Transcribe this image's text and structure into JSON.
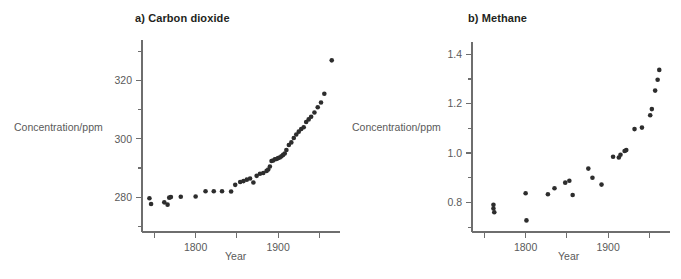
{
  "figure": {
    "background": "#ffffff",
    "point_color": "#2d2d2d",
    "axis_color": "#6e6e6e",
    "text_color": "#5a5a5a",
    "title_color": "#231f20"
  },
  "panels": {
    "a": {
      "title": "a) Carbon dioxide",
      "xlabel": "Year",
      "ylabel": "Concentration/ppm",
      "y_ticks_labeled": [
        "280",
        "300",
        "320"
      ],
      "x_ticks_labeled": [
        "1800",
        "1900"
      ]
    },
    "b": {
      "title": "b) Methane",
      "xlabel": "Year",
      "ylabel": "Concentration/ppm",
      "y_ticks_labeled": [
        "0.8",
        "1.0",
        "1.2",
        "1.4"
      ],
      "x_ticks_labeled": [
        "1800",
        "1900"
      ]
    }
  },
  "chart_data": [
    {
      "id": "carbon-dioxide",
      "type": "scatter",
      "title": "a) Carbon dioxide",
      "xlabel": "Year",
      "ylabel": "Concentration/ppm",
      "xlim": [
        1735,
        1975
      ],
      "ylim": [
        268,
        334
      ],
      "x_major_ticks": [
        1750,
        1800,
        1850,
        1900,
        1950
      ],
      "x_tick_labels": {
        "1800": "1800",
        "1900": "1900"
      },
      "y_major_ticks": [
        280,
        300,
        320
      ],
      "y_minor_ticks": [
        270,
        290,
        310,
        330
      ],
      "grid": false,
      "legend": null,
      "x": [
        1744,
        1746,
        1762,
        1766,
        1768,
        1770,
        1782,
        1800,
        1812,
        1822,
        1832,
        1843,
        1848,
        1854,
        1858,
        1862,
        1866,
        1870,
        1874,
        1878,
        1882,
        1886,
        1888,
        1890,
        1892,
        1894,
        1896,
        1898,
        1900,
        1902,
        1904,
        1906,
        1908,
        1910,
        1913,
        1916,
        1919,
        1922,
        1925,
        1928,
        1931,
        1934,
        1937,
        1940,
        1944,
        1948,
        1952,
        1956,
        1965
      ],
      "y": [
        279.6,
        277.6,
        278.2,
        277.4,
        279.8,
        280.0,
        280.1,
        280.2,
        282.0,
        282.0,
        282.0,
        281.9,
        284.2,
        285.2,
        285.5,
        286.0,
        286.4,
        285.0,
        287.3,
        288.0,
        288.3,
        289.0,
        289.5,
        290.5,
        292.4,
        292.6,
        293.0,
        293.1,
        293.4,
        293.6,
        294.0,
        294.5,
        295.0,
        296.2,
        297.9,
        298.8,
        300.3,
        301.5,
        302.5,
        303.4,
        304.0,
        305.8,
        306.7,
        307.6,
        309.1,
        310.9,
        312.5,
        315.5,
        327.0
      ]
    },
    {
      "id": "methane",
      "type": "scatter",
      "title": "b) Methane",
      "xlabel": "Year",
      "ylabel": "Concentration/ppm",
      "xlim": [
        1735,
        1975
      ],
      "ylim": [
        0.68,
        1.45
      ],
      "x_major_ticks": [
        1750,
        1800,
        1850,
        1900,
        1950
      ],
      "x_tick_labels": {
        "1800": "1800",
        "1900": "1900"
      },
      "y_major_ticks": [
        0.8,
        1.0,
        1.2,
        1.4
      ],
      "y_minor_ticks": [
        0.7,
        0.9,
        1.1,
        1.3
      ],
      "grid": false,
      "legend": null,
      "x": [
        1761,
        1761,
        1762,
        1800,
        1801,
        1827,
        1835,
        1848,
        1853,
        1857,
        1876,
        1881,
        1892,
        1906,
        1913,
        1915,
        1920,
        1922,
        1932,
        1941,
        1951,
        1953,
        1957,
        1960,
        1962
      ],
      "y": [
        0.79,
        0.775,
        0.76,
        0.837,
        0.727,
        0.833,
        0.857,
        0.88,
        0.888,
        0.83,
        0.937,
        0.9,
        0.872,
        0.985,
        0.982,
        0.993,
        1.008,
        1.012,
        1.097,
        1.103,
        1.153,
        1.178,
        1.253,
        1.297,
        1.337
      ]
    }
  ]
}
